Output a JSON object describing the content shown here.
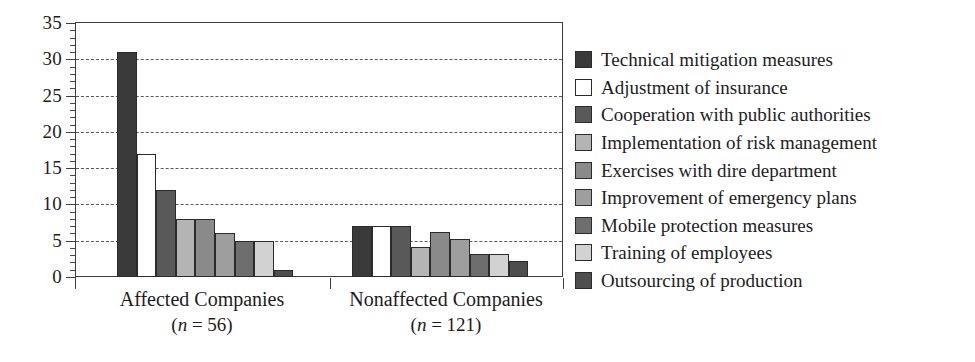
{
  "chart_data": {
    "type": "bar",
    "title": "",
    "xlabel": "",
    "ylabel": "",
    "ylim": [
      0,
      35
    ],
    "y_ticks": [
      0,
      5,
      10,
      15,
      20,
      25,
      30,
      35
    ],
    "y_minor_tick_step": 1,
    "grid": "horizontal dashed gridlines at 5,10,15,20,25,30",
    "legend_position": "right",
    "categories": [
      "Affected Companies",
      "Nonaffected Companies"
    ],
    "category_sublabels": [
      "(n = 56)",
      "(n = 121)"
    ],
    "category_n": [
      56,
      121
    ],
    "series": [
      {
        "name": "Technical mitigation measures",
        "values": [
          31,
          7.0
        ],
        "color": "#3a3a3a"
      },
      {
        "name": "Adjustment of insurance",
        "values": [
          17,
          7.0
        ],
        "color": "#ffffff"
      },
      {
        "name": "Cooperation with public authorities",
        "values": [
          12,
          7.0
        ],
        "color": "#595959"
      },
      {
        "name": "Implementation of risk management",
        "values": [
          8,
          4.2
        ],
        "color": "#b4b4b4"
      },
      {
        "name": "Exercises with dire department",
        "values": [
          8,
          6.2
        ],
        "color": "#8a8a8a"
      },
      {
        "name": "Improvement of emergency plans",
        "values": [
          6,
          5.2
        ],
        "color": "#9e9e9e"
      },
      {
        "name": "Mobile protection measures",
        "values": [
          5,
          3.2
        ],
        "color": "#6e6e6e"
      },
      {
        "name": "Training of employees",
        "values": [
          5,
          3.2
        ],
        "color": "#d2d2d2"
      },
      {
        "name": "Outsourcing of production",
        "values": [
          1,
          2.2
        ],
        "color": "#4e4e4e"
      }
    ]
  },
  "axes": {
    "y_tick_labels": [
      "0",
      "5",
      "10",
      "15",
      "20",
      "25",
      "30",
      "35"
    ]
  },
  "legend": {
    "items": [
      "Technical mitigation measures",
      "Adjustment of insurance",
      "Cooperation with public authorities",
      "Implementation of risk management",
      "Exercises with dire department",
      "Improvement of emergency plans",
      "Mobile protection measures",
      "Training of employees",
      "Outsourcing of production"
    ]
  },
  "colors": {
    "axis": "#3c3c3c",
    "grid": "#5a5a5a",
    "text": "#1d1d1d",
    "background": "#ffffff"
  }
}
